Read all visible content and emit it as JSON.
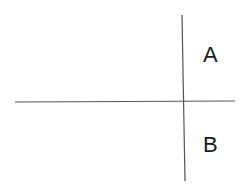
{
  "diagram": {
    "labels": {
      "a": "A",
      "b": "B"
    },
    "lines": {
      "horizontal": {
        "x1": 15,
        "y1": 102,
        "x2": 235,
        "y2": 101
      },
      "vertical": {
        "x1": 182,
        "y1": 15,
        "x2": 185,
        "y2": 181
      }
    },
    "colors": {
      "line": "#555555",
      "text": "#1a1a1a",
      "background": "#ffffff"
    }
  }
}
